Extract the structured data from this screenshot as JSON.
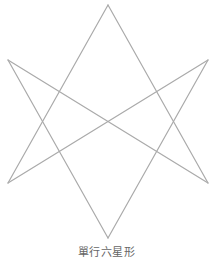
{
  "diagram": {
    "title": "單行六星形",
    "shape": "unicursal-hexagram",
    "stroke_color": "#aaaaaa",
    "stroke_width": 1.2,
    "vertices": {
      "top": [
        108,
        5
      ],
      "upper_left": [
        8,
        60
      ],
      "upper_right": [
        208,
        60
      ],
      "lower_left": [
        8,
        183
      ],
      "lower_right": [
        208,
        183
      ],
      "bottom": [
        108,
        238
      ]
    },
    "segments": [
      [
        "top",
        "lower_left"
      ],
      [
        "top",
        "lower_right"
      ],
      [
        "upper_left",
        "bottom"
      ],
      [
        "upper_right",
        "bottom"
      ],
      [
        "upper_left",
        "lower_right"
      ],
      [
        "lower_left",
        "upper_right"
      ]
    ]
  },
  "caption": {
    "text": "單行六星形"
  }
}
